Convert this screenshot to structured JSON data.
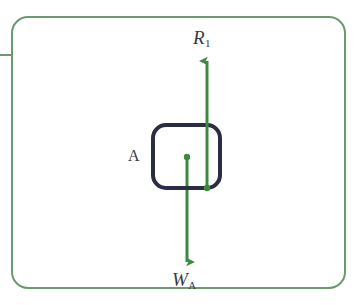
{
  "figure": {
    "kind": "free-body-diagram",
    "caption_visible": false,
    "background_color": "#ffffff"
  },
  "frame": {
    "name": "rounded-frame",
    "color": "#6a9a6d",
    "stroke_width": 2,
    "corner_radius": 16,
    "x": 12,
    "y": 17,
    "width": 333,
    "height": 271,
    "tab": {
      "name": "left-tab",
      "x1": 0,
      "y1": 55,
      "x2": 13,
      "y2": 55
    }
  },
  "block": {
    "name": "block-A",
    "label": "A",
    "color": "#2b2d42",
    "stroke_width": 4,
    "corner_radius": 13,
    "x": 153,
    "y": 125,
    "width": 67,
    "height": 63,
    "center_x": 187,
    "center_y": 157
  },
  "vectors": [
    {
      "id": "R1",
      "name": "normal-reaction-vector",
      "label_base": "R",
      "label_sub": "1",
      "meaning": "normal reaction force on block A",
      "direction": "up",
      "color": "#3b8a3f",
      "stroke_width": 3,
      "x": 207,
      "tail_y": 188,
      "tip_y": 55,
      "length_px": 133,
      "has_tail_dot": true,
      "tail_dot_radius": 3.2,
      "label_x": 193,
      "label_y": 28
    },
    {
      "id": "WA",
      "name": "weight-vector",
      "label_base": "W",
      "label_sub": "A",
      "meaning": "weight of block A",
      "direction": "down",
      "color": "#3b8a3f",
      "stroke_width": 3,
      "x": 187,
      "tail_y": 157,
      "tip_y": 268,
      "length_px": 111,
      "has_tail_dot": true,
      "tail_dot_radius": 3.2,
      "label_x": 172,
      "label_y": 270
    }
  ],
  "labels": {
    "block": "A",
    "reaction_base": "R",
    "reaction_sub": "1",
    "weight_base": "W",
    "weight_sub": "A"
  },
  "colors": {
    "frame_green": "#6a9a6d",
    "vector_green": "#3b8a3f",
    "block_navy": "#2b2d42",
    "text_gray": "#3a3a44",
    "background": "#ffffff"
  }
}
